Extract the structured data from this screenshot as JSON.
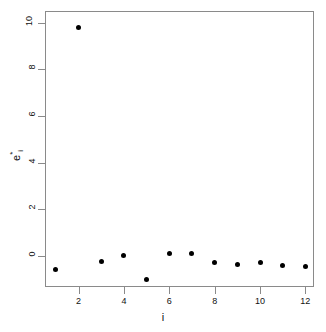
{
  "chart_data": {
    "type": "scatter",
    "title": "",
    "xlabel": "i",
    "ylabel": "e*i",
    "ylabel_parts": {
      "base": "e",
      "superscript": "*",
      "subscript": "i"
    },
    "x": [
      1,
      2,
      3,
      4,
      5,
      6,
      7,
      8,
      9,
      10,
      11,
      12
    ],
    "values": [
      -0.6,
      9.8,
      -0.25,
      0.0,
      -1.0,
      0.1,
      0.12,
      -0.3,
      -0.35,
      -0.3,
      -0.4,
      -0.45
    ],
    "series": [
      {
        "name": "standardized residuals",
        "points": [
          {
            "x": 1,
            "y": -0.6
          },
          {
            "x": 2,
            "y": 9.8
          },
          {
            "x": 3,
            "y": -0.25
          },
          {
            "x": 4,
            "y": 0.0
          },
          {
            "x": 5,
            "y": -1.0
          },
          {
            "x": 6,
            "y": 0.1
          },
          {
            "x": 7,
            "y": 0.12
          },
          {
            "x": 8,
            "y": -0.3
          },
          {
            "x": 9,
            "y": -0.35
          },
          {
            "x": 10,
            "y": -0.3
          },
          {
            "x": 11,
            "y": -0.4
          },
          {
            "x": 12,
            "y": -0.45
          }
        ]
      }
    ],
    "xticks": [
      2,
      4,
      6,
      8,
      10,
      12
    ],
    "xtick_labels": [
      "2",
      "4",
      "6",
      "8",
      "10",
      "12"
    ],
    "yticks": [
      0,
      2,
      4,
      6,
      8,
      10
    ],
    "ytick_labels": [
      "0",
      "2",
      "4",
      "6",
      "8",
      "10"
    ],
    "xlim": [
      0.52,
      12.38
    ],
    "ylim": [
      -1.33,
      10.5
    ],
    "grid": false,
    "legend": false,
    "marker": "filled-circle",
    "marker_color": "#000000",
    "frame_color": "#8a8a8a",
    "background": "#ffffff"
  }
}
